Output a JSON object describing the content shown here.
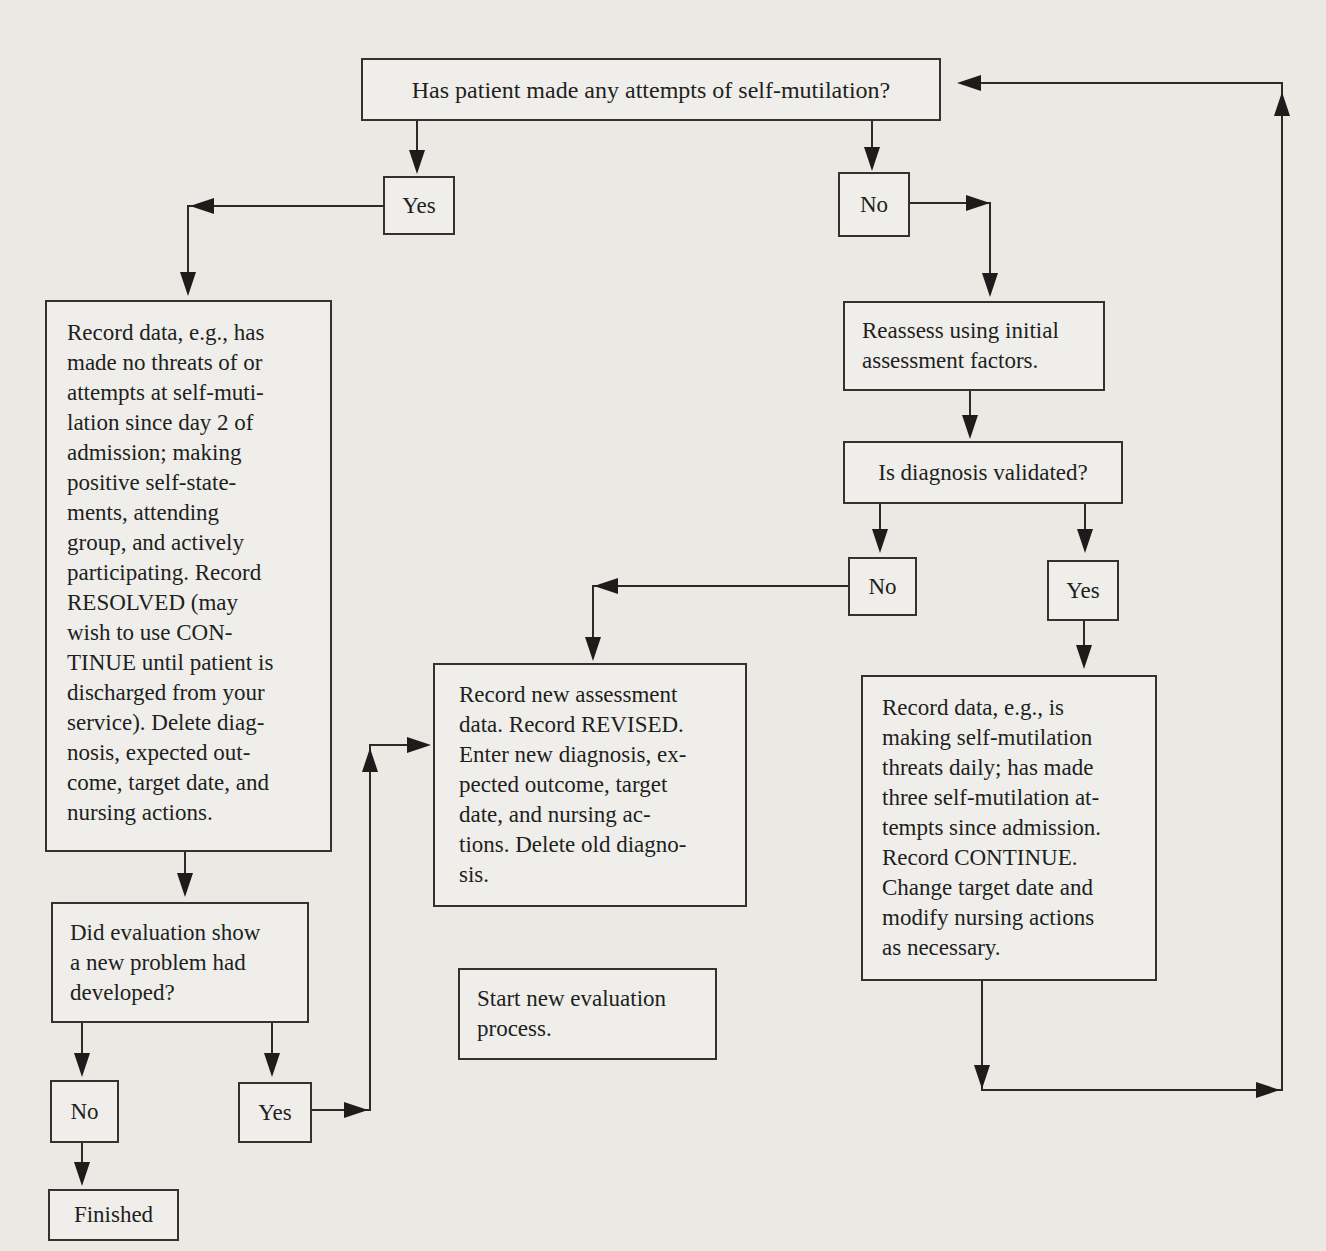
{
  "page": {
    "background_color": "#ebe9e4",
    "box_fill_color": "#f0eeea",
    "line_color": "#2b2a27",
    "text_color": "#201f1d"
  },
  "nodes": {
    "q_self_mutilation": {
      "text": "Has patient made any attempts of self-mutilation?"
    },
    "yes_top": {
      "text": "Yes"
    },
    "no_top": {
      "text": "No"
    },
    "record_resolved": {
      "text": "Record data, e.g., has\nmade no threats of or\nattempts at self-muti-\nlation since day 2 of\nadmission; making\npositive self-state-\nments, attending\ngroup, and actively\nparticipating. Record\nRESOLVED (may\nwish to use CON-\nTINUE until patient is\ndischarged from your\nservice). Delete diag-\nnosis, expected out-\ncome, target date, and\nnursing actions."
    },
    "q_new_problem": {
      "text": "Did evaluation show\na new problem had\ndeveloped?"
    },
    "no_new_problem": {
      "text": "No"
    },
    "yes_new_problem": {
      "text": "Yes"
    },
    "finished": {
      "text": "Finished"
    },
    "record_revised": {
      "text": "Record new assessment\ndata. Record REVISED.\nEnter new diagnosis, ex-\npected outcome, target\ndate, and nursing ac-\ntions. Delete old diagno-\nsis."
    },
    "start_new_evaluation": {
      "text": "Start new evaluation\nprocess."
    },
    "reassess": {
      "text": "Reassess using initial\nassessment factors."
    },
    "q_diagnosis_validated": {
      "text": "Is diagnosis validated?"
    },
    "no_validated": {
      "text": "No"
    },
    "yes_validated": {
      "text": "Yes"
    },
    "record_continue": {
      "text": "Record data, e.g., is\nmaking self-mutilation\nthreats daily; has made\nthree self-mutilation at-\ntempts since admission.\nRecord CONTINUE.\nChange target date and\nmodify nursing actions\nas necessary."
    }
  }
}
